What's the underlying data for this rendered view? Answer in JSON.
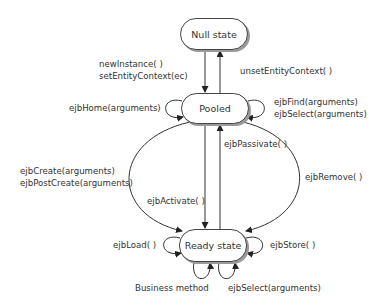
{
  "diagram": {
    "type": "state-diagram",
    "states": {
      "null_state": "Null state",
      "pooled": "Pooled",
      "ready_state": "Ready state"
    },
    "transitions": {
      "null_to_pooled": [
        "newInstance( )",
        "setEntityContext(ec)"
      ],
      "pooled_to_null": "unsetEntityContext( )",
      "pooled_self_left": "ejbHome(arguments)",
      "pooled_self_right": [
        "ejbFind(arguments)",
        "ejbSelect(arguments)"
      ],
      "pooled_to_ready_create": [
        "ejbCreate(arguments)",
        "ejbPostCreate(arguments)"
      ],
      "pooled_to_ready_activate": "ejbActivate( )",
      "ready_to_pooled_passivate": "ejbPassivate( )",
      "ready_to_pooled_remove": "ejbRemove( )",
      "ready_self_left": "ejbLoad( )",
      "ready_self_right": "ejbStore( )",
      "ready_self_bottom_left": "Business method",
      "ready_self_bottom_right": "ejbSelect(arguments)"
    },
    "colors": {
      "line": "#333333",
      "text": "#333333",
      "shadow": "#9a9a9a"
    }
  }
}
